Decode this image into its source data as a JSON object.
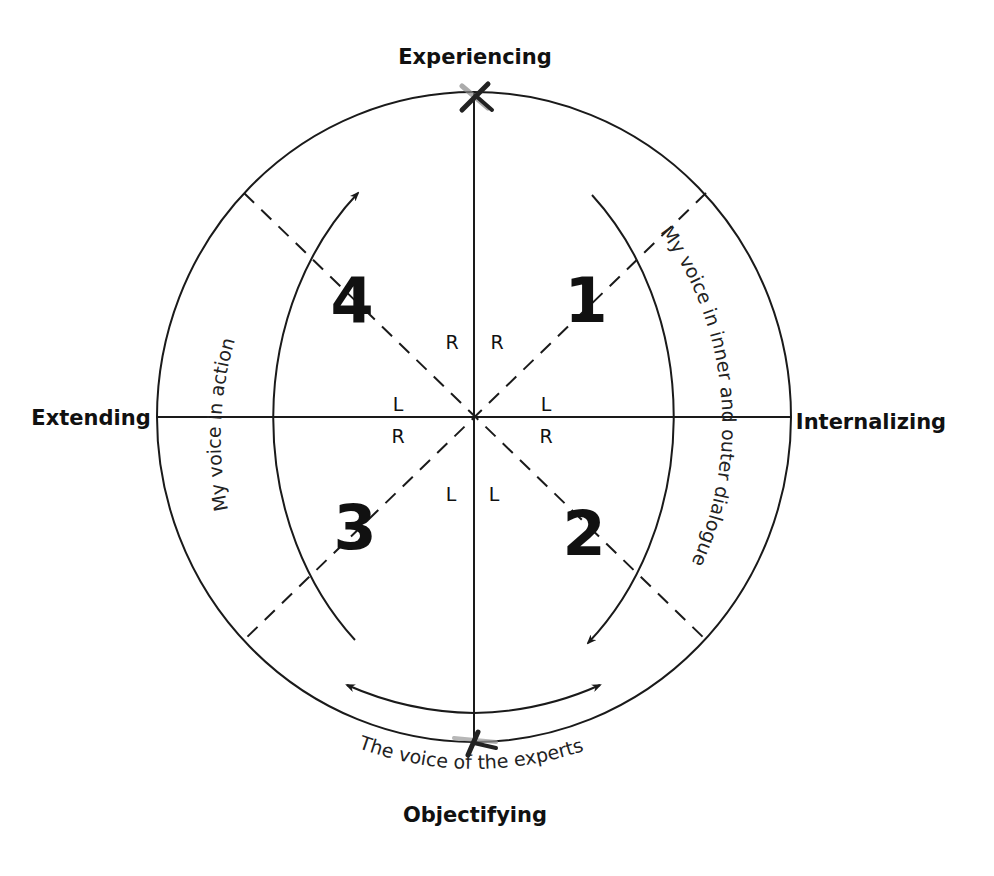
{
  "diagram": {
    "axes": {
      "top": "Experiencing",
      "bottom": "Objectifying",
      "left": "Extending",
      "right": "Internalizing"
    },
    "quadrants": [
      {
        "number": "1",
        "position": "upper-right"
      },
      {
        "number": "2",
        "position": "lower-right"
      },
      {
        "number": "3",
        "position": "lower-left"
      },
      {
        "number": "4",
        "position": "upper-left"
      }
    ],
    "hemisphere_marks": {
      "upper_left_R": "R",
      "upper_right_R": "R",
      "left_L": "L",
      "left_R": "R",
      "right_L": "L",
      "right_R": "R",
      "lower_left_L": "L",
      "lower_right_L": "L"
    },
    "arc_labels": {
      "right": "My voice in inner and outer dialogue",
      "left": "My voice in action",
      "bottom": "The voice of the experts"
    },
    "colors": {
      "line": "#1a1a1a",
      "background": "#ffffff"
    }
  }
}
